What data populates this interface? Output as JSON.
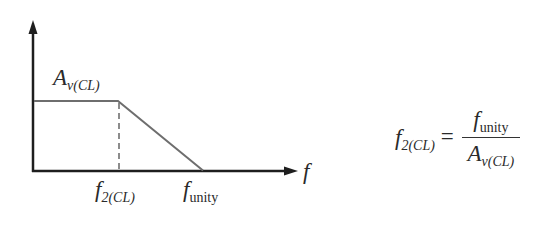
{
  "diagram": {
    "type": "closed-loop frequency response (Bode magnitude, idealized)",
    "colors": {
      "axes": "#1e1e1e",
      "response_curve": "#6e6e6e",
      "dashed_marker": "#707070",
      "text": "#2a2a2a",
      "background": "#ffffff"
    },
    "axes": {
      "x_label": "f",
      "y_label": ""
    },
    "labels": {
      "gain": {
        "main": "A",
        "sub": "v(CL)"
      },
      "cutoff": {
        "main": "f",
        "sub": "2(CL)"
      },
      "unity": {
        "main": "f",
        "sub": "unity"
      },
      "x_axis": "f"
    },
    "curve_points": [
      {
        "x": 33,
        "y": 101
      },
      {
        "x": 118,
        "y": 101
      },
      {
        "x": 203,
        "y": 171
      }
    ]
  },
  "formula": {
    "lhs": {
      "main": "f",
      "sub": "2(CL)"
    },
    "equals": "=",
    "numerator": {
      "main": "f",
      "sub": "unity"
    },
    "denominator": {
      "main": "A",
      "sub": "v(CL)"
    }
  }
}
